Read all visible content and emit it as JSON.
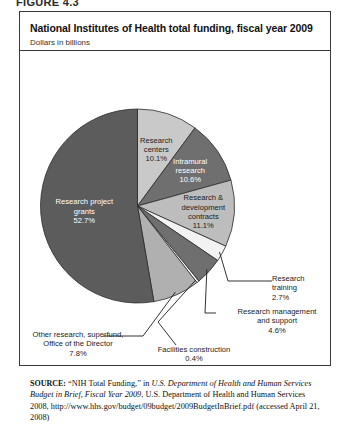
{
  "figure": {
    "label": "FIGURE 4.3"
  },
  "chart": {
    "title": "National Institutes of Health total funding, fiscal year 2009",
    "subtitle": "Dollars in billions"
  },
  "chart_data": {
    "type": "pie",
    "title": "National Institutes of Health total funding, fiscal year 2009",
    "subtitle": "Dollars in billions",
    "unit": "percent",
    "legend": "none",
    "labels_inside": true,
    "start_angle_deg": 0,
    "direction": "clockwise",
    "categories": [
      "Research centers",
      "Intramural research",
      "Research & development contracts",
      "Research training",
      "Research management and support",
      "Facilities construction",
      "Other research, superfund, Office of the Director",
      "Research project grants"
    ],
    "values": [
      10.1,
      10.6,
      11.1,
      2.7,
      4.6,
      0.4,
      7.8,
      52.7
    ],
    "slices": [
      {
        "name": "Research centers",
        "value": 10.1,
        "value_label": "10.1%",
        "color": "#c9c9c9",
        "label_placement": "inside",
        "label_color": "#1c1c1c",
        "lines": [
          "Research",
          "centers",
          "10.1%"
        ]
      },
      {
        "name": "Intramural research",
        "value": 10.6,
        "value_label": "10.6%",
        "color": "#6f6f6f",
        "label_placement": "inside",
        "label_color": "#ffffff",
        "lines": [
          "Intramural",
          "research",
          "10.6%"
        ]
      },
      {
        "name": "Research & development contracts",
        "value": 11.1,
        "value_label": "11.1%",
        "color": "#bdbdbd",
        "label_placement": "inside",
        "label_color": "#1c1c1c",
        "lines": [
          "Research &",
          "development",
          "contracts",
          "11.1%"
        ]
      },
      {
        "name": "Research training",
        "value": 2.7,
        "value_label": "2.7%",
        "color": "#f2f2f2",
        "label_placement": "callout",
        "label_color": "#1c1c1c",
        "lines": [
          "Research",
          "training",
          "2.7%"
        ]
      },
      {
        "name": "Research management and support",
        "value": 4.6,
        "value_label": "4.6%",
        "color": "#6f6f6f",
        "label_placement": "callout",
        "label_color": "#1c1c1c",
        "lines": [
          "Research management",
          "and support",
          "4.6%"
        ]
      },
      {
        "name": "Facilities construction",
        "value": 0.4,
        "value_label": "0.4%",
        "color": "#ffffff",
        "label_placement": "callout",
        "label_color": "#1c1c1c",
        "lines": [
          "Facilities construction",
          "0.4%"
        ]
      },
      {
        "name": "Other research, superfund, Office of the Director",
        "value": 7.8,
        "value_label": "7.8%",
        "color": "#b0b0b0",
        "label_placement": "callout",
        "label_color": "#1c1c1c",
        "lines": [
          "Other research, superfund,",
          "Office of the Director",
          "7.8%"
        ]
      },
      {
        "name": "Research project grants",
        "value": 52.7,
        "value_label": "52.7%",
        "color": "#5c5c5c",
        "label_placement": "inside",
        "label_color": "#ffffff",
        "lines": [
          "Research project",
          "grants",
          "52.7%"
        ]
      }
    ]
  },
  "source": {
    "prefix": "SOURCE:",
    "text_1": "“NIH Total Funding,” in ",
    "italic_1": "U.S. Department of Health and Human Services Budget in Brief, Fiscal Year 2009",
    "text_2": ", U.S. Department of Health and Human Services 2008, http://www.hhs.gov/budget/09budget/2009BudgetInBrief.pdf (accessed April 21, 2008)"
  }
}
